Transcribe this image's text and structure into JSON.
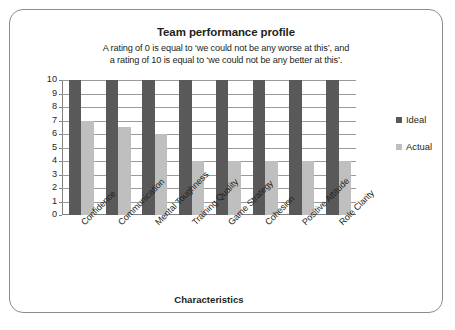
{
  "chart_data": {
    "type": "bar",
    "title": "Team performance profile",
    "subtitle_line_1": "A rating of 0 is equal to ‘we could not be any worse at this’, and",
    "subtitle_line_2": "a rating of 10 is equal to ‘we could not be any better at this’.",
    "xlabel": "Characteristics",
    "ylabel": "Ratings",
    "ylim": [
      0,
      10
    ],
    "ytick_labels": [
      "10",
      "9",
      "8",
      "7",
      "6",
      "5",
      "4",
      "3",
      "2",
      "1",
      "0"
    ],
    "yticks": [
      10,
      9,
      8,
      7,
      6,
      5,
      4,
      3,
      2,
      1,
      0
    ],
    "grid": true,
    "legend_position": "right",
    "categories": [
      "Confidence",
      "Communication",
      "Mental Toughness",
      "Training Quality",
      "Game Strategy",
      "Cohesion",
      "Positive Attitude",
      "Role Clarity"
    ],
    "series": [
      {
        "name": "Ideal",
        "color": "#595959",
        "values": [
          10,
          10,
          10,
          10,
          10,
          10,
          10,
          10
        ]
      },
      {
        "name": "Actual",
        "color": "#bfbfbf",
        "values": [
          7,
          6.5,
          6,
          4,
          4,
          4,
          4,
          4
        ]
      }
    ]
  },
  "legend": {
    "items": [
      {
        "label": "Ideal",
        "color": "#595959"
      },
      {
        "label": "Actual",
        "color": "#bfbfbf"
      }
    ]
  },
  "colors": {
    "frame_border": "#8c8c8c",
    "axis": "#808080",
    "gridline": "#9a9a9a",
    "text": "#231f20"
  }
}
